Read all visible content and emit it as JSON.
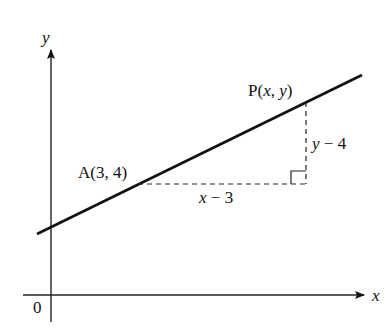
{
  "diagram": {
    "type": "coordinate-geometry",
    "axes": {
      "x_label": "x",
      "y_label": "y",
      "origin_label": "0"
    },
    "points": [
      {
        "id": "A",
        "label": "A(3, 4)"
      },
      {
        "id": "P",
        "label_prefix": "P(",
        "label_x": "x",
        "label_sep": ", ",
        "label_y": "y",
        "label_suffix": ")"
      }
    ],
    "segments": {
      "horizontal": {
        "label_var": "x",
        "label_rest": " − 3"
      },
      "vertical": {
        "label_var": "y",
        "label_rest": " − 4"
      }
    },
    "colors": {
      "ink": "#111111",
      "background": "#ffffff"
    }
  }
}
